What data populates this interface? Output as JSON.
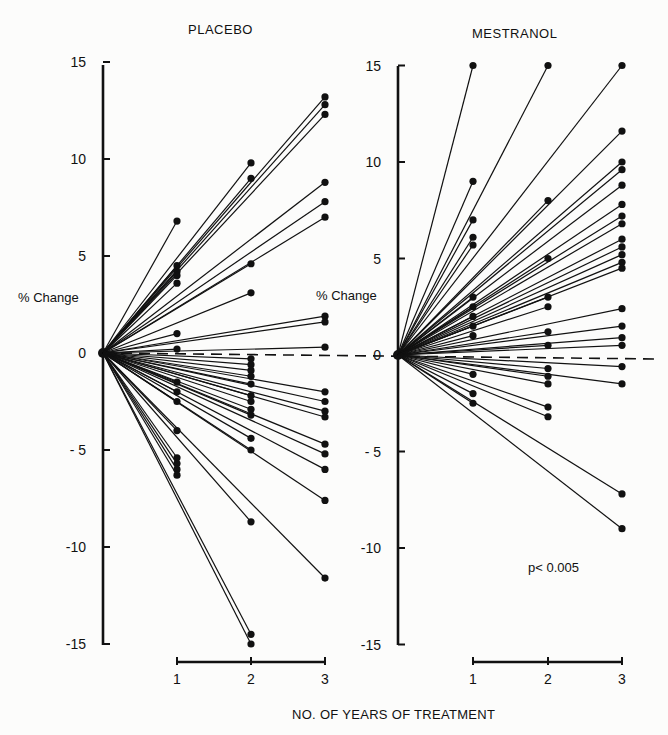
{
  "chart_data": [
    {
      "type": "line",
      "title": "PLACEBO",
      "xlabel": "NO. OF YEARS OF TREATMENT",
      "ylabel": "% Change",
      "ylim": [
        -15,
        15
      ],
      "yticks": [
        15,
        10,
        5,
        0,
        -5,
        -10,
        -15
      ],
      "ytick_labels": [
        "15",
        "10",
        "5",
        "0",
        "- 5",
        "-10",
        "-15"
      ],
      "xticks": [
        1,
        2,
        3
      ],
      "xtick_labels": [
        "1",
        "2",
        "3"
      ],
      "reference_line": {
        "y": 0,
        "style": "dashed"
      },
      "grid": false,
      "description": "Each line runs from origin (0 years, 0% change) to one subject's % change at the year measured",
      "points_by_year": {
        "1": [
          6.8,
          4.5,
          4.2,
          4.0,
          3.6,
          1.0,
          0.2,
          -1.5,
          -2.0,
          -2.5,
          -4.0,
          -5.4,
          -5.7,
          -6.0,
          -6.3
        ],
        "2": [
          9.8,
          9.0,
          4.6,
          3.1,
          -0.3,
          -0.6,
          -0.9,
          -1.2,
          -1.6,
          -2.2,
          -2.5,
          -2.9,
          -3.2,
          -4.4,
          -5.0,
          -8.7,
          -14.5,
          -15.0
        ],
        "3": [
          13.2,
          12.8,
          12.3,
          8.8,
          7.8,
          7.0,
          1.9,
          1.6,
          0.3,
          -2.0,
          -2.5,
          -3.0,
          -3.3,
          -4.7,
          -5.2,
          -6.0,
          -7.6,
          -11.6
        ]
      }
    },
    {
      "type": "line",
      "title": "MESTRANOL",
      "xlabel": "NO. OF YEARS OF TREATMENT",
      "ylabel": "% Change",
      "ylim": [
        -15,
        15
      ],
      "yticks": [
        15,
        10,
        5,
        0,
        -5,
        -10,
        -15
      ],
      "ytick_labels": [
        "15",
        "10",
        "5",
        "0",
        "- 5",
        "-10",
        "-15"
      ],
      "xticks": [
        1,
        2,
        3
      ],
      "xtick_labels": [
        "1",
        "2",
        "3"
      ],
      "reference_line": {
        "y": 0,
        "style": "dashed"
      },
      "grid": false,
      "annotation": "p< 0.005",
      "description": "Each line runs from origin (0 years, 0% change) to one subject's % change at the year measured",
      "points_by_year": {
        "1": [
          15.0,
          9.0,
          7.0,
          6.1,
          5.7,
          3.0,
          2.5,
          2.0,
          1.5,
          1.0,
          -1.0,
          -2.0,
          -2.5
        ],
        "2": [
          15.0,
          8.0,
          5.0,
          3.0,
          2.5,
          1.2,
          0.5,
          -0.7,
          -1.1,
          -1.5,
          -2.7,
          -3.2
        ],
        "3": [
          15.0,
          11.6,
          10.0,
          9.6,
          8.8,
          7.8,
          7.2,
          6.8,
          6.0,
          5.6,
          5.2,
          4.8,
          4.5,
          2.4,
          1.5,
          0.9,
          0.5,
          -0.6,
          -1.5,
          -7.2,
          -9.0
        ]
      }
    }
  ],
  "labels": {
    "placebo_title": "PLACEBO",
    "mestranol_title": "MESTRANOL",
    "ylabel_left": "% Change",
    "ylabel_right": "% Change",
    "xlabel": "NO. OF YEARS OF TREATMENT",
    "annotation": "p< 0.005",
    "yticks": [
      "15",
      "10",
      "5",
      "0",
      "- 5",
      "-10",
      "-15"
    ],
    "xticks": [
      "1",
      "2",
      "3"
    ]
  },
  "layout": {
    "placebo": {
      "x0": 103,
      "xyear": [
        177,
        251,
        325
      ],
      "y0": 353,
      "ppu": 19.4,
      "axis_top": 65,
      "axis_bottom": 645
    },
    "mestranol": {
      "x0": 398,
      "xyear": [
        473,
        548,
        622
      ],
      "y0": 355,
      "ppu": 19.3,
      "axis_top": 66,
      "axis_bottom": 645
    },
    "ink_color": "#111111"
  }
}
